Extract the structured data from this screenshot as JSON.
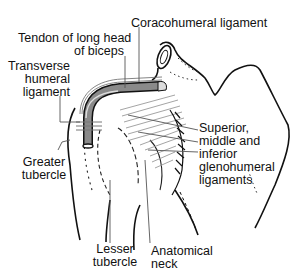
{
  "diagram": {
    "labels": {
      "coracohumeral": "Coracohumeral ligament",
      "tendon_line1": "Tendon of long head",
      "tendon_line2": "of biceps",
      "transverse_line1": "Transverse",
      "transverse_line2": "humeral",
      "transverse_line3": "ligament",
      "glenohumeral_line1": "Superior,",
      "glenohumeral_line2": "middle and",
      "glenohumeral_line3": "inferior",
      "glenohumeral_line4": "glenohumeral",
      "glenohumeral_line5": "ligaments",
      "greater_line1": "Greater",
      "greater_line2": "tubercle",
      "lesser_line1": "Lesser",
      "lesser_line2": "tubercle",
      "anatomical_line1": "Anatomical",
      "anatomical_line2": "neck"
    },
    "colors": {
      "line": "#111111",
      "leader": "#555555",
      "tendon_fill": "#8a8a8a",
      "ligament_hatch": "#9a9a9a"
    }
  }
}
